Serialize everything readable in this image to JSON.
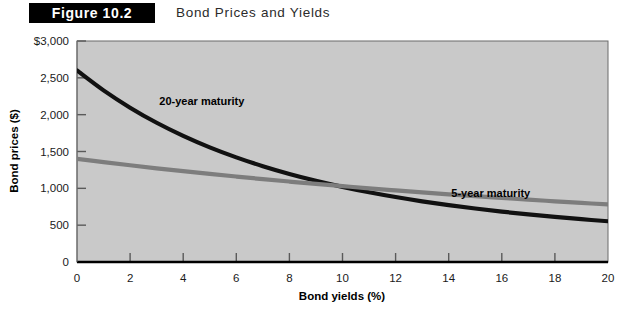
{
  "figure": {
    "badge_label": "Figure 10.2",
    "title": "Bond Prices and Yields"
  },
  "chart_data": {
    "type": "line",
    "title": "Bond Prices and Yields",
    "xlabel": "Bond yields (%)",
    "ylabel": "Bond prices ($)",
    "xlim": [
      0,
      20
    ],
    "ylim": [
      0,
      3000
    ],
    "grid": false,
    "legend_position": "inline-annotations",
    "plot_background": "#c9c9c9",
    "x_ticks": [
      0,
      2,
      4,
      6,
      8,
      10,
      12,
      14,
      16,
      18,
      20
    ],
    "x_tick_labels": [
      "0",
      "2",
      "4",
      "6",
      "8",
      "10",
      "12",
      "14",
      "16",
      "18",
      "20"
    ],
    "y_ticks": [
      0,
      500,
      1000,
      1500,
      2000,
      2500,
      3000
    ],
    "y_tick_labels": [
      "0",
      "500",
      "1,000",
      "1,500",
      "2,000",
      "2,500",
      "$3,000"
    ],
    "x": [
      0,
      1,
      2,
      3,
      4,
      5,
      6,
      7,
      8,
      9,
      10,
      11,
      12,
      13,
      14,
      15,
      16,
      17,
      18,
      19,
      20
    ],
    "series": [
      {
        "name": "20-year maturity",
        "color": "#111111",
        "label_x": 3.1,
        "label_y": 2130,
        "values": [
          2600,
          2330,
          2095,
          1890,
          1712,
          1556,
          1420,
          1300,
          1195,
          1102,
          1020,
          947,
          882,
          824,
          772,
          726,
          684,
          646,
          612,
          581,
          553
        ]
      },
      {
        "name": "5-year maturity",
        "color": "#7d7d7d",
        "label_x": 14.1,
        "label_y": 880,
        "values": [
          1400,
          1356,
          1313,
          1272,
          1233,
          1196,
          1160,
          1125,
          1092,
          1060,
          1030,
          1000,
          972,
          945,
          919,
          894,
          870,
          846,
          824,
          802,
          781
        ]
      }
    ],
    "annotations": [
      {
        "text": "20-year maturity",
        "x": 3.1,
        "y": 2130
      },
      {
        "text": "5-year maturity",
        "x": 14.1,
        "y": 880
      }
    ]
  }
}
